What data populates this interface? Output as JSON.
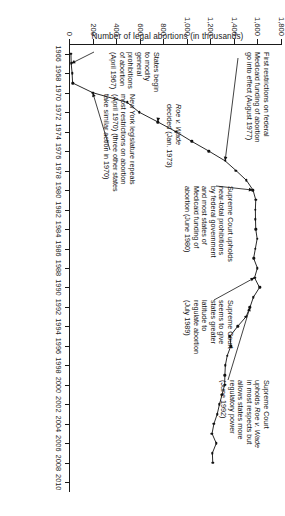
{
  "chart_data": {
    "type": "line",
    "title": "",
    "xlabel": "",
    "ylabel": "Number of legal abortions (in thousands)",
    "xlim": [
      1965,
      2011
    ],
    "ylim": [
      0,
      1800
    ],
    "ytick_labels": [
      "0",
      "200",
      "400",
      "600",
      "800",
      "1,000",
      "1,200",
      "1,400",
      "1,600",
      "1,800"
    ],
    "ytick_values": [
      0,
      200,
      400,
      600,
      800,
      1000,
      1200,
      1400,
      1600,
      1800
    ],
    "xtick_labels": [
      "1966",
      "1968",
      "1970",
      "1972",
      "1974",
      "1976",
      "1978",
      "1980",
      "1982",
      "1984",
      "1986",
      "1988",
      "1990",
      "1992",
      "1994",
      "1996",
      "1998",
      "2000",
      "2002",
      "2004",
      "2006",
      "2008",
      "2010"
    ],
    "xtick_values": [
      1966,
      1968,
      1970,
      1972,
      1974,
      1976,
      1978,
      1980,
      1982,
      1984,
      1986,
      1988,
      1990,
      1992,
      1994,
      1996,
      1998,
      2000,
      2002,
      2004,
      2006,
      2008,
      2010
    ],
    "grid": false,
    "legend": false,
    "marker": "filled-circle",
    "x": [
      1966,
      1967,
      1968,
      1969,
      1970,
      1971,
      1972,
      1973,
      1974,
      1975,
      1976,
      1977,
      1978,
      1979,
      1980,
      1981,
      1982,
      1983,
      1984,
      1985,
      1986,
      1987,
      1988,
      1989,
      1990,
      1991,
      1992,
      1993,
      1994,
      1995,
      1996,
      1997,
      1998,
      1999,
      2000,
      2001,
      2002,
      2003,
      2004,
      2005,
      2006,
      2007,
      2008
    ],
    "values": [
      8,
      10,
      18,
      22,
      193,
      486,
      587,
      745,
      899,
      1034,
      1179,
      1317,
      1410,
      1498,
      1554,
      1577,
      1574,
      1575,
      1577,
      1589,
      1574,
      1559,
      1591,
      1567,
      1609,
      1557,
      1529,
      1495,
      1423,
      1359,
      1366,
      1335,
      1319,
      1315,
      1313,
      1291,
      1269,
      1250,
      1222,
      1206,
      1242,
      1209,
      1212
    ]
  },
  "axis": {
    "y_title": "Number of legal abortions (in thousands)"
  },
  "annotations": [
    {
      "id": "first-restrictions-medicaid",
      "text": "First restrictions on federal\nMedicaid funding of abortion\ngo into effect (August 1977)",
      "target_year": 1977,
      "target_value": 1317
    },
    {
      "id": "supreme-court-upholds-medicaid-prohibitions",
      "text": "Supreme Court upholds\nnear-total prohibitions\nby federal government\nand most states of\nMedicaid funding of\nabortion (June 1980)",
      "target_year": 1980,
      "target_value": 1554
    },
    {
      "id": "supreme-court-states-greater-latitude",
      "text": "Supreme Court\nseems to give\nstates greater\nlatitude to\nregulate abortion\n(July 1989)",
      "target_year": 1989,
      "target_value": 1567
    },
    {
      "id": "supreme-court-upholds-roe",
      "text": "Supreme Court\nupholds Roe v. Wade\nin most respects but\nallows states more\nregulatory power\n(June 1992)",
      "target_year": 1992,
      "target_value": 1529
    },
    {
      "id": "roe-v-wade-decided",
      "text": "Roe v. Wade\ndecided (Jan. 1973)",
      "target_year": 1973,
      "target_value": 745
    },
    {
      "id": "new-york-repeals",
      "text": "New York legislature repeals\nmost restrictions on abortion\n(April 1970) (three other states\ntake similar action in 1970)",
      "target_year": 1970,
      "target_value": 193
    },
    {
      "id": "states-begin-to-modify",
      "text": "States begin\nto modify\ngeneral\nprohibitions\nof abortion\n(April 1967)",
      "target_year": 1967,
      "target_value": 10
    }
  ]
}
